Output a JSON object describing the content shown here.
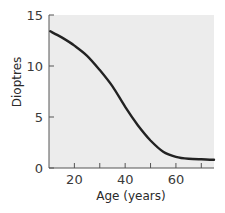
{
  "chart_data": {
    "type": "line",
    "title": "",
    "xlabel": "Age (years)",
    "ylabel": "Dioptres",
    "xlim": [
      10,
      75
    ],
    "ylim": [
      0,
      15
    ],
    "x_ticks": [
      20,
      30,
      40,
      50,
      60,
      70
    ],
    "x_tick_labels": [
      "20",
      "",
      "40",
      "",
      "60",
      ""
    ],
    "y_ticks": [
      0,
      5,
      10,
      15
    ],
    "y_tick_labels": [
      "0",
      "5",
      "10",
      "15"
    ],
    "grid": false,
    "legend": null,
    "background": "#ececec",
    "line_color": "#222222",
    "series": [
      {
        "name": "Amplitude of accommodation",
        "x": [
          10.5,
          15,
          20,
          25,
          30,
          35,
          40,
          45,
          50,
          55,
          60,
          65,
          70,
          75
        ],
        "y": [
          13.4,
          12.8,
          12.0,
          11.0,
          9.6,
          8.0,
          6.0,
          4.2,
          2.7,
          1.6,
          1.1,
          0.9,
          0.85,
          0.8
        ]
      }
    ]
  }
}
